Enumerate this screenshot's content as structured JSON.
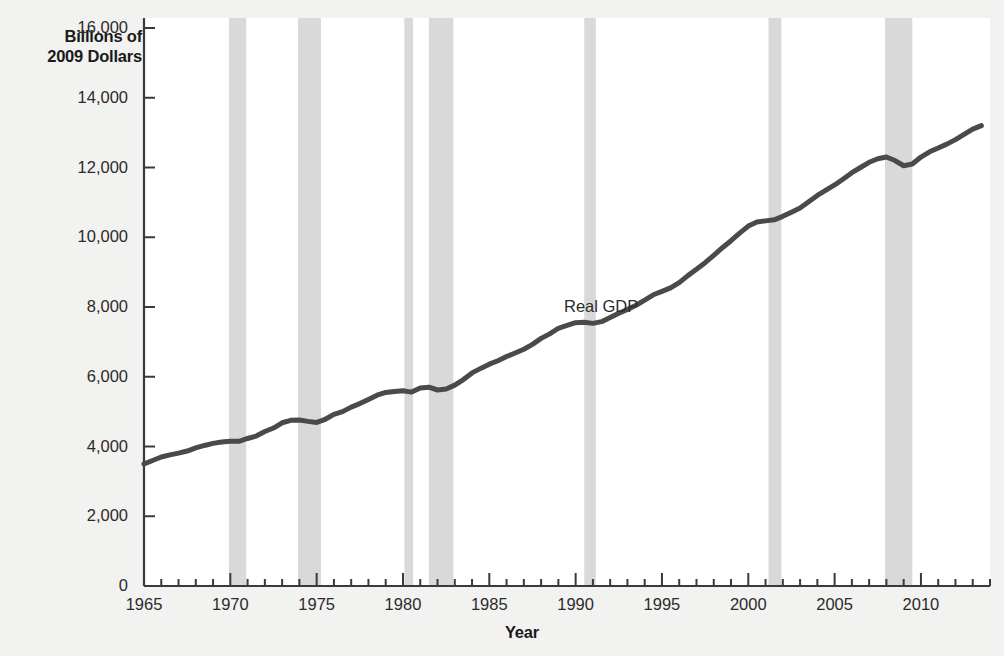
{
  "chart_data": {
    "type": "line",
    "title": "",
    "xlabel": "Year",
    "ylabel": "Billions of\n2009 Dollars",
    "ylabel_line1": "Billions of",
    "ylabel_line2": "2009 Dollars",
    "series_annotation": "Real GDP",
    "xlim": [
      1965,
      2014
    ],
    "ylim": [
      0,
      16000
    ],
    "y_ticks": [
      0,
      2000,
      4000,
      6000,
      8000,
      10000,
      12000,
      14000,
      16000
    ],
    "y_tick_labels": [
      "0",
      "2,000",
      "4,000",
      "6,000",
      "8,000",
      "10,000",
      "12,000",
      "14,000",
      "16,000"
    ],
    "x_ticks": [
      1965,
      1970,
      1975,
      1980,
      1985,
      1990,
      1995,
      2000,
      2005,
      2010
    ],
    "x_tick_labels": [
      "1965",
      "1970",
      "1975",
      "1980",
      "1985",
      "1990",
      "1995",
      "2000",
      "2005",
      "2010"
    ],
    "x_minor_tick_step": 1,
    "grid": false,
    "legend_position": "inline-annotation",
    "line_color": "#4a4a4a",
    "line_width": 5,
    "recession_band_color": "#d9d9d9",
    "background_color": "#f2f2f0",
    "plot_background_color": "#ffffff",
    "axis_color": "#3a3a3a",
    "series": [
      {
        "name": "Real GDP",
        "units": "Billions of 2009 Dollars",
        "x": [
          1965,
          1965.5,
          1966,
          1966.5,
          1967,
          1967.5,
          1968,
          1968.5,
          1969,
          1969.5,
          1970,
          1970.5,
          1971,
          1971.5,
          1972,
          1972.5,
          1973,
          1973.5,
          1974,
          1974.5,
          1975,
          1975.5,
          1976,
          1976.5,
          1977,
          1977.5,
          1978,
          1978.5,
          1979,
          1979.5,
          1980,
          1980.5,
          1981,
          1981.5,
          1982,
          1982.5,
          1983,
          1983.5,
          1984,
          1984.5,
          1985,
          1985.5,
          1986,
          1986.5,
          1987,
          1987.5,
          1988,
          1988.5,
          1989,
          1989.5,
          1990,
          1990.5,
          1991,
          1991.5,
          1992,
          1992.5,
          1993,
          1993.5,
          1994,
          1994.5,
          1995,
          1995.5,
          1996,
          1996.5,
          1997,
          1997.5,
          1998,
          1998.5,
          1999,
          1999.5,
          2000,
          2000.5,
          2001,
          2001.5,
          2002,
          2002.5,
          2003,
          2003.5,
          2004,
          2004.5,
          2005,
          2005.5,
          2006,
          2006.5,
          2007,
          2007.5,
          2008,
          2008.5,
          2009,
          2009.5,
          2010,
          2010.5,
          2011,
          2011.5,
          2012,
          2012.5,
          2013,
          2013.5
        ],
        "values": [
          3500,
          3600,
          3700,
          3760,
          3810,
          3870,
          3960,
          4030,
          4090,
          4130,
          4150,
          4150,
          4230,
          4300,
          4430,
          4530,
          4680,
          4750,
          4760,
          4720,
          4690,
          4780,
          4920,
          5000,
          5130,
          5230,
          5350,
          5470,
          5550,
          5580,
          5600,
          5560,
          5680,
          5700,
          5620,
          5650,
          5760,
          5920,
          6110,
          6240,
          6360,
          6460,
          6580,
          6680,
          6790,
          6930,
          7100,
          7230,
          7390,
          7470,
          7550,
          7560,
          7530,
          7580,
          7700,
          7820,
          7930,
          8050,
          8200,
          8350,
          8450,
          8550,
          8700,
          8900,
          9080,
          9270,
          9480,
          9700,
          9900,
          10120,
          10320,
          10440,
          10470,
          10500,
          10600,
          10720,
          10840,
          11020,
          11200,
          11350,
          11500,
          11670,
          11850,
          12000,
          12150,
          12250,
          12300,
          12200,
          12050,
          12100,
          12300,
          12450,
          12560,
          12670,
          12800,
          12950,
          13100,
          13200
        ],
        "start_value": 3500,
        "end_value": 13500,
        "notable_points": [
          {
            "year": 1965,
            "value": 3500,
            "note": "series start"
          },
          {
            "year": 1970,
            "value": 4150,
            "note": "1970 recession plateau"
          },
          {
            "year": 1974,
            "value": 4760,
            "note": "peak before 1974-75 recession"
          },
          {
            "year": 1975,
            "value": 4690,
            "note": "1974-75 recession trough"
          },
          {
            "year": 1980,
            "value": 5600,
            "note": "1980 recession"
          },
          {
            "year": 1982,
            "value": 5620,
            "note": "1981-82 recession trough"
          },
          {
            "year": 1990.5,
            "value": 7560,
            "note": "1990-91 recession flat"
          },
          {
            "year": 2001,
            "value": 10470,
            "note": "2001 recession slowdown"
          },
          {
            "year": 2007.8,
            "value": 12300,
            "note": "pre-crisis peak"
          },
          {
            "year": 2009.2,
            "value": 12050,
            "note": "Great Recession trough"
          },
          {
            "year": 2013.8,
            "value": 13500,
            "note": "series end"
          }
        ]
      }
    ],
    "recession_bands": [
      {
        "start": 1969.92,
        "end": 1970.92,
        "label": "1969-70 recession"
      },
      {
        "start": 1973.92,
        "end": 1975.25,
        "label": "1973-75 recession"
      },
      {
        "start": 1980.08,
        "end": 1980.58,
        "label": "1980 recession"
      },
      {
        "start": 1981.5,
        "end": 1982.92,
        "label": "1981-82 recession"
      },
      {
        "start": 1990.5,
        "end": 1991.17,
        "label": "1990-91 recession"
      },
      {
        "start": 2001.17,
        "end": 2001.92,
        "label": "2001 recession"
      },
      {
        "start": 2007.92,
        "end": 2009.5,
        "label": "2007-09 Great Recession"
      }
    ]
  }
}
